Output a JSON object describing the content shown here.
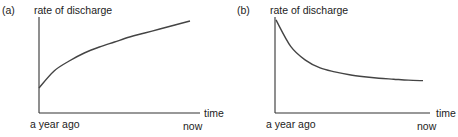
{
  "chart_data": [
    {
      "type": "line",
      "panel_label": "(a)",
      "title": "",
      "ylabel": "rate of discharge",
      "xlabel": "time",
      "x_tick_labels": [
        "a year ago",
        "now"
      ],
      "shape": "increasing, concave (rises quickly then levels off)",
      "x": [
        0,
        0.1,
        0.2,
        0.3,
        0.4,
        0.5,
        0.6,
        0.7,
        0.8,
        0.9,
        1.0
      ],
      "series": [
        {
          "name": "rate of discharge",
          "values": [
            0.25,
            0.42,
            0.52,
            0.6,
            0.66,
            0.71,
            0.76,
            0.8,
            0.84,
            0.88,
            0.92
          ]
        }
      ],
      "ylim": [
        0,
        1
      ],
      "xlim": [
        0,
        1
      ],
      "grid": false,
      "legend": "none"
    },
    {
      "type": "line",
      "panel_label": "(b)",
      "title": "",
      "ylabel": "rate of discharge",
      "xlabel": "time",
      "x_tick_labels": [
        "a year ago",
        "now"
      ],
      "shape": "decreasing, convex (falls quickly then levels off)",
      "x": [
        0,
        0.1,
        0.2,
        0.3,
        0.4,
        0.5,
        0.6,
        0.7,
        0.8,
        0.9,
        1.0
      ],
      "series": [
        {
          "name": "rate of discharge",
          "values": [
            0.95,
            0.68,
            0.54,
            0.46,
            0.42,
            0.39,
            0.37,
            0.355,
            0.345,
            0.335,
            0.33
          ]
        }
      ],
      "ylim": [
        0,
        1
      ],
      "xlim": [
        0,
        1
      ],
      "grid": false,
      "legend": "none"
    }
  ]
}
